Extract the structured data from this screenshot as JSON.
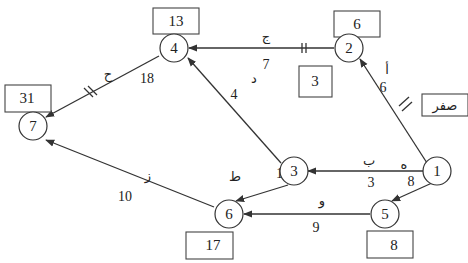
{
  "diagram": {
    "type": "activity-network",
    "nodes": [
      {
        "id": "1",
        "label": "1",
        "time": "صفر"
      },
      {
        "id": "2",
        "label": "2",
        "time": "6"
      },
      {
        "id": "3",
        "label": "3",
        "time": "3"
      },
      {
        "id": "4",
        "label": "4",
        "time": "13"
      },
      {
        "id": "5",
        "label": "5",
        "time": "8"
      },
      {
        "id": "6",
        "label": "6",
        "time": "17"
      },
      {
        "id": "7",
        "label": "7",
        "time": "31"
      }
    ],
    "edges": [
      {
        "from": "1",
        "to": "2",
        "activity": "أ",
        "duration": "6",
        "critical": true
      },
      {
        "from": "1",
        "to": "3",
        "activity": "ب",
        "duration": "3",
        "critical": false
      },
      {
        "from": "2",
        "to": "4",
        "activity": "ج",
        "duration": "7",
        "critical": true
      },
      {
        "from": "3",
        "to": "4",
        "activity": "د",
        "duration": "4",
        "critical": false
      },
      {
        "from": "1",
        "to": "5",
        "activity": "ه",
        "duration": "8",
        "critical": false
      },
      {
        "from": "5",
        "to": "6",
        "activity": "و",
        "duration": "9",
        "critical": false
      },
      {
        "from": "3",
        "to": "6",
        "activity": "ط",
        "duration": "14",
        "critical": false
      },
      {
        "from": "4",
        "to": "7",
        "activity": "ح",
        "duration": "18",
        "critical": true
      },
      {
        "from": "6",
        "to": "7",
        "activity": "ز",
        "duration": "10",
        "critical": false
      }
    ]
  }
}
